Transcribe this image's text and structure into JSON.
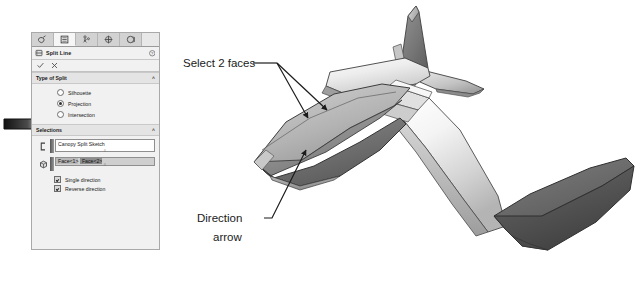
{
  "app": {
    "panel_title": "Split Line",
    "tabs": [
      {
        "name": "feature-manager-tab",
        "icon": "tree-icon"
      },
      {
        "name": "property-manager-tab",
        "icon": "property-page-icon",
        "active": true
      },
      {
        "name": "configuration-manager-tab",
        "icon": "configuration-icon"
      },
      {
        "name": "dimxpert-manager-tab",
        "icon": "dimxpert-icon"
      },
      {
        "name": "display-manager-tab",
        "icon": "appearance-sphere-icon"
      }
    ],
    "header": {
      "icon": "split-line-icon",
      "title": "Split Line",
      "help_icon": "help-question-icon"
    },
    "actions": {
      "ok_icon": "green-check-icon",
      "cancel_icon": "red-x-icon"
    },
    "sections": [
      {
        "name": "type-of-split",
        "title": "Type of Split",
        "collapse_icon": "chevron-up-icon",
        "options": [
          {
            "label": "Silhouette",
            "selected": false
          },
          {
            "label": "Projection",
            "selected": true
          },
          {
            "label": "Intersection",
            "selected": false
          }
        ]
      },
      {
        "name": "selections",
        "title": "Selections",
        "collapse_icon": "chevron-up-icon",
        "sketch_field": {
          "icon": "sketch-region-icon",
          "value": "Canopy Split Sketch",
          "placeholder": ""
        },
        "faces_field": {
          "icon": "faces-to-split-icon",
          "items": [
            {
              "label": "Face<1>",
              "selected": false
            },
            {
              "label": "Face<2>",
              "selected": true
            }
          ]
        },
        "checkboxes": [
          {
            "label": "Single direction",
            "checked": true
          },
          {
            "label": "Reverse direction",
            "checked": true
          }
        ]
      }
    ]
  },
  "annotations": [
    {
      "name": "select-2-faces-callout",
      "text": "Select 2 faces"
    },
    {
      "name": "direction-arrow-callout-line1",
      "text": "Direction"
    },
    {
      "name": "direction-arrow-callout-line2",
      "text": "arrow"
    }
  ],
  "pointer": {
    "name": "projection-pointer-arrow",
    "color_dark": "#1a1a1a",
    "color_light": "#ffffff"
  },
  "model": {
    "name": "airplane-3d-model",
    "description": "Shaded 3D airplane model viewed from above rear, showing fuselage, canopy split faces, vertical tail fin, horizontal stabilizer, swept wing and dark wingtip pod",
    "colors": {
      "body_light": "#f2f2f2",
      "body_mid": "#a8a8a8",
      "body_dark": "#6e6e6e",
      "accent_darkest": "#4b4b4b",
      "outline": "#3a3a3a"
    }
  }
}
